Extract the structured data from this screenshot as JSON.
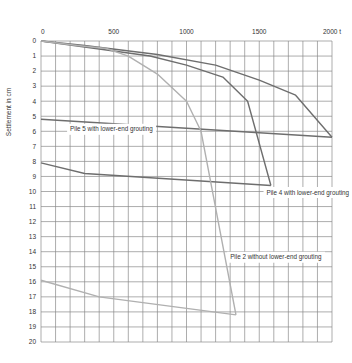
{
  "chart_data": {
    "type": "line",
    "title": "",
    "xlabel": "t",
    "ylabel": "Settlement in cm",
    "xlim": [
      0,
      2000
    ],
    "ylim": [
      20,
      0
    ],
    "x_ticks": [
      {
        "value": 0,
        "label": "0"
      },
      {
        "value": 500,
        "label": "500"
      },
      {
        "value": 1000,
        "label": "1000"
      },
      {
        "value": 1500,
        "label": "1500"
      },
      {
        "value": 2000,
        "label": "2000 t"
      }
    ],
    "y_ticks": [
      "0",
      "1",
      "2",
      "3",
      "4",
      "5",
      "6",
      "7",
      "8",
      "9",
      "10",
      "11",
      "12",
      "13",
      "14",
      "15",
      "16",
      "17",
      "18",
      "19",
      "20"
    ],
    "grid": true,
    "grid_x_step": 100,
    "grid_y_step": 1,
    "legend": "inline annotations",
    "series": [
      {
        "name": "Pile 5 with lower-end grouting",
        "color": "#6e6e6e",
        "loading": [
          [
            0,
            0
          ],
          [
            300,
            0.3
          ],
          [
            800,
            0.9
          ],
          [
            1200,
            1.6
          ],
          [
            1500,
            2.6
          ],
          [
            1750,
            3.6
          ],
          [
            2000,
            6.4
          ]
        ],
        "unloading": [
          [
            2000,
            6.4
          ],
          [
            0,
            5.2
          ]
        ],
        "label_pos": [
          200,
          6.0
        ]
      },
      {
        "name": "Pile 4 with lower-end grouting",
        "color": "#6e6e6e",
        "loading": [
          [
            0,
            0
          ],
          [
            300,
            0.4
          ],
          [
            750,
            1.0
          ],
          [
            1000,
            1.6
          ],
          [
            1250,
            2.4
          ],
          [
            1420,
            4.0
          ],
          [
            1580,
            9.6
          ]
        ],
        "unloading": [
          [
            1580,
            9.6
          ],
          [
            300,
            8.8
          ],
          [
            0,
            8.1
          ]
        ],
        "label_pos": [
          1550,
          10.2
        ]
      },
      {
        "name": "Pile 2 without lower-end grouting",
        "color": "#b0b0b0",
        "loading": [
          [
            0,
            0
          ],
          [
            250,
            0.3
          ],
          [
            450,
            0.5
          ],
          [
            600,
            1.0
          ],
          [
            800,
            2.2
          ],
          [
            1000,
            4.0
          ],
          [
            1100,
            6.0
          ],
          [
            1340,
            18.2
          ]
        ],
        "unloading": [
          [
            1340,
            18.2
          ],
          [
            400,
            17.0
          ],
          [
            0,
            15.9
          ]
        ],
        "label_pos": [
          1300,
          14.5
        ]
      }
    ],
    "annotations": [
      {
        "text": "Pile 5 with lower-end grouting"
      },
      {
        "text": "Pile 4 with lower-end grouting"
      },
      {
        "text": "Pile 2 without lower-end grouting"
      }
    ]
  }
}
